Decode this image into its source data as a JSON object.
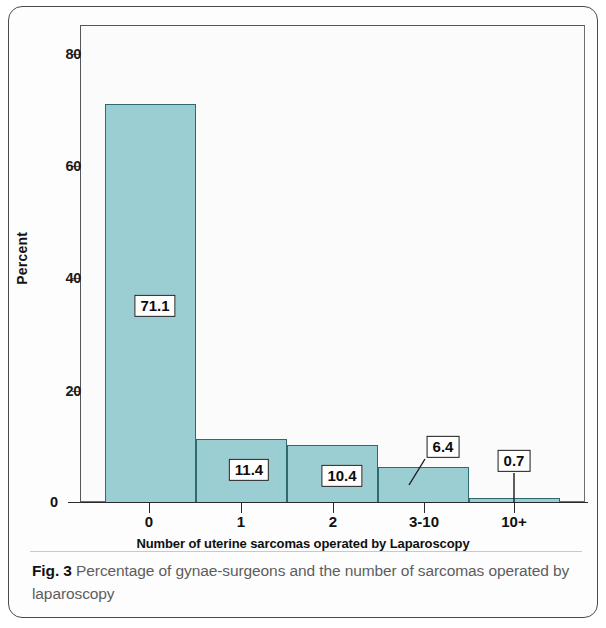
{
  "figure": {
    "caption_number": "Fig. 3",
    "caption_text": "Percentage of gynae-surgeons and the number of sarcomas operated by laparoscopy"
  },
  "chart_data": {
    "type": "bar",
    "title": "",
    "xlabel": "Number of uterine sarcomas operated by Laparoscopy",
    "ylabel": "Percent",
    "categories": [
      "0",
      "1",
      "2",
      "3-10",
      "10+"
    ],
    "values": [
      71.1,
      11.4,
      10.4,
      6.4,
      0.7
    ],
    "data_labels": [
      "71.1",
      "11.4",
      "10.4",
      "6.4",
      "0.7"
    ],
    "ylim": [
      0,
      85
    ],
    "yticks": [
      0,
      20,
      40,
      60,
      80
    ],
    "ytick_labels": [
      "0",
      "20",
      "40",
      "60",
      "80"
    ],
    "grid": false,
    "legend": false,
    "bar_fill_color": "#9bced3",
    "bar_edge_color": "#2f6a72"
  }
}
